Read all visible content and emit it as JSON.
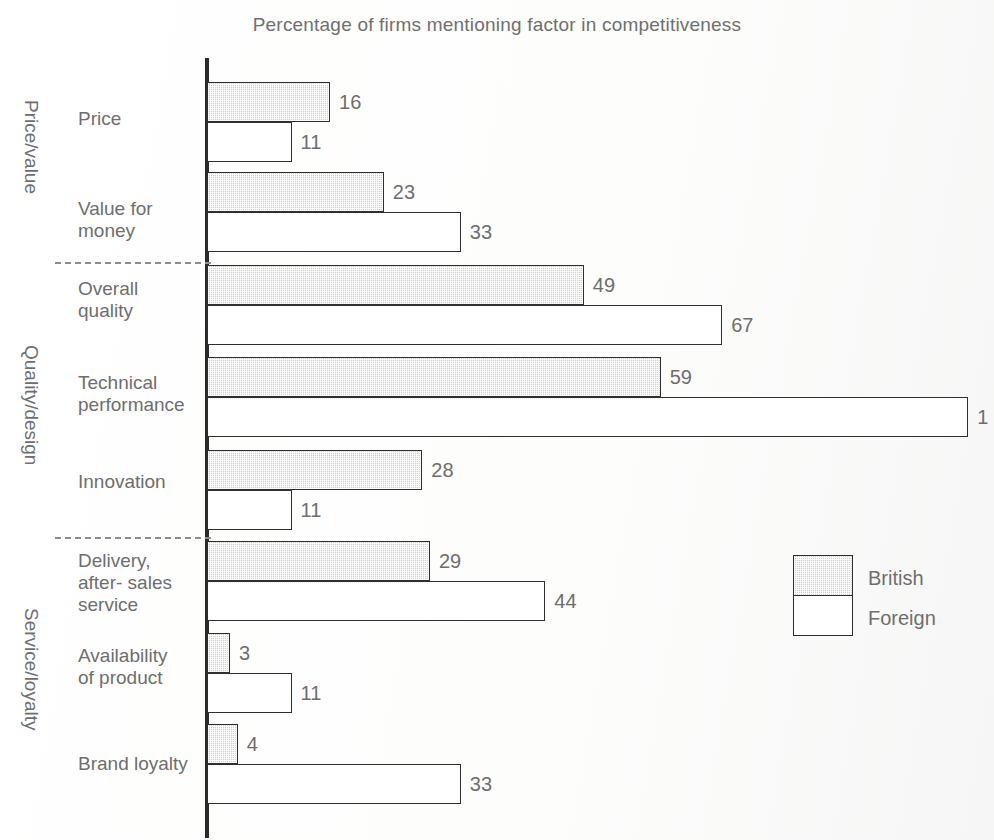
{
  "chart_data": {
    "type": "bar",
    "orientation": "horizontal",
    "title": "Percentage of firms mentioning factor in competitiveness",
    "xlabel": "",
    "ylabel": "",
    "xlim": [
      0,
      102
    ],
    "grid": false,
    "legend_position": "right-middle",
    "categories": [
      "Price",
      "Value for\nmoney",
      "Overall\nquality",
      "Technical\nperformance",
      "Innovation",
      "Delivery,\nafter- sales\nservice",
      "Availability\nof product",
      "Brand loyalty"
    ],
    "series": [
      {
        "name": "British",
        "values": [
          16,
          23,
          49,
          59,
          28,
          29,
          3,
          4
        ]
      },
      {
        "name": "Foreign",
        "values": [
          11,
          33,
          67,
          99,
          11,
          44,
          11,
          33
        ]
      }
    ],
    "value_labels": {
      "British": [
        "16",
        "23",
        "49",
        "59",
        "28",
        "29",
        "3",
        "4"
      ],
      "Foreign": [
        "11",
        "33",
        "67",
        "1",
        "11",
        "44",
        "11",
        "33"
      ]
    },
    "groups": [
      {
        "label": "Price/value",
        "categories": [
          "Price",
          "Value for money"
        ]
      },
      {
        "label": "Quality/design",
        "categories": [
          "Overall quality",
          "Technical performance",
          "Innovation"
        ]
      },
      {
        "label": "Service/loyalty",
        "categories": [
          "Delivery, after- sales service",
          "Availability of product",
          "Brand loyalty"
        ]
      }
    ]
  },
  "legend": {
    "entries": [
      {
        "label": "British",
        "swatch": "shaded-gray"
      },
      {
        "label": "Foreign",
        "swatch": "white"
      }
    ]
  },
  "colors": {
    "british_fill": "#cfcfcf",
    "foreign_fill": "#ffffff",
    "outline": "#2f2f2f",
    "text": "#6e6e6e",
    "axis": "#2b2b2b",
    "background": "#fdfdfd"
  },
  "rows": [
    {
      "category": "Price",
      "label": "Price",
      "british": 16,
      "foreign": 11,
      "british_label": "16",
      "foreign_label": "11",
      "y": 82,
      "label_y": 108,
      "group": "Price/value"
    },
    {
      "category": "Value for money",
      "label": "Value for\nmoney",
      "british": 23,
      "foreign": 33,
      "british_label": "23",
      "foreign_label": "33",
      "y": 172,
      "label_y": 198,
      "group": "Price/value"
    },
    {
      "category": "Overall quality",
      "label": "Overall\nquality",
      "british": 49,
      "foreign": 67,
      "british_label": "49",
      "foreign_label": "67",
      "y": 265,
      "label_y": 278,
      "group": "Quality/design"
    },
    {
      "category": "Technical performance",
      "label": "Technical\nperformance",
      "british": 59,
      "foreign": 99,
      "british_label": "59",
      "foreign_label": "1",
      "y": 357,
      "label_y": 372,
      "group": "Quality/design"
    },
    {
      "category": "Innovation",
      "label": "Innovation",
      "british": 28,
      "foreign": 11,
      "british_label": "28",
      "foreign_label": "11",
      "y": 450,
      "label_y": 471,
      "group": "Quality/design"
    },
    {
      "category": "Delivery, after- sales service",
      "label": "Delivery,\nafter- sales\nservice",
      "british": 29,
      "foreign": 44,
      "british_label": "29",
      "foreign_label": "44",
      "y": 541,
      "label_y": 550,
      "group": "Service/loyalty"
    },
    {
      "category": "Availability of product",
      "label": "Availability\nof product",
      "british": 3,
      "foreign": 11,
      "british_label": "3",
      "foreign_label": "11",
      "y": 633,
      "label_y": 645,
      "group": "Service/loyalty"
    },
    {
      "category": "Brand loyalty",
      "label": "Brand loyalty",
      "british": 4,
      "foreign": 33,
      "british_label": "4",
      "foreign_label": "33",
      "y": 724,
      "label_y": 753,
      "group": "Service/loyalty"
    }
  ],
  "group_labels": [
    {
      "text": "Price/value",
      "x": 42,
      "y": 100
    },
    {
      "text": "Quality/design",
      "x": 42,
      "y": 345
    },
    {
      "text": "Service/loyalty",
      "x": 42,
      "y": 608
    }
  ],
  "dividers": [
    {
      "y": 262
    },
    {
      "y": 537
    }
  ]
}
